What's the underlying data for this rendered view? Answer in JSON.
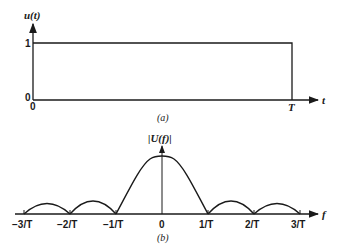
{
  "figure_a": {
    "y_label": "u(t)",
    "x_label": "t",
    "y_tick_high": "1",
    "y_tick_low": "0",
    "x_tick_origin": "0",
    "x_tick_end": "T",
    "caption": "(a)"
  },
  "figure_b": {
    "y_label": "|U(f)|",
    "x_label": "f",
    "x_ticks": [
      "−3/T",
      "−2/T",
      "−1/T",
      "0",
      "1/T",
      "2/T",
      "3/T"
    ],
    "caption": "(b)"
  },
  "colors": {
    "ink": "#1a1a1a",
    "background": "#ffffff"
  }
}
